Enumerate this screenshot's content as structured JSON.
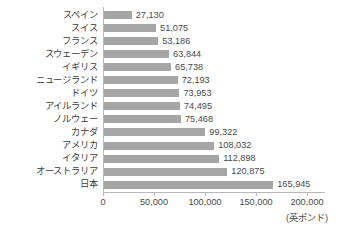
{
  "chart_data": {
    "type": "bar",
    "orientation": "horizontal",
    "title": "",
    "subtitle": "",
    "xlabel": "(英ポンド)",
    "ylabel": "",
    "categories": [
      "スペイン",
      "スイス",
      "フランス",
      "スウェーデン",
      "イギリス",
      "ニュージランド",
      "ドイツ",
      "アイルランド",
      "ノルウェー",
      "カナダ",
      "アメリカ",
      "イタリア",
      "オーストラリア",
      "日本"
    ],
    "values": [
      27130,
      51075,
      53186,
      63844,
      65738,
      72193,
      73953,
      74495,
      75468,
      99322,
      108032,
      112898,
      120875,
      165945
    ],
    "value_labels": [
      "27,130",
      "51,075",
      "53,186",
      "63,844",
      "65,738",
      "72,193",
      "73,953",
      "74,495",
      "75,468",
      "99,322",
      "108,032",
      "112,898",
      "120,875",
      "165,945"
    ],
    "xlim": [
      0,
      200000
    ],
    "xticks": [
      0,
      50000,
      100000,
      150000,
      200000
    ],
    "xtick_labels": [
      "0",
      "50,000",
      "100,000",
      "150,000",
      "200,000"
    ],
    "grid": false,
    "legend": null,
    "bar_color": "#a6a6a6",
    "axis_color": "#b9b9b9",
    "text_color": "#3c3c3c"
  }
}
